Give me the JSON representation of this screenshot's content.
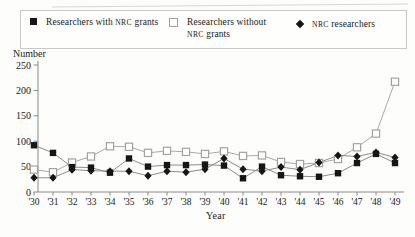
{
  "figure": {
    "ylabel": "Number",
    "xlabel": "Year"
  },
  "chart_data": {
    "type": "line",
    "title": "",
    "xlabel": "Year",
    "ylabel": "Number",
    "ylim": [
      0,
      250
    ],
    "yticks": [
      0,
      50,
      100,
      150,
      200,
      250
    ],
    "grid": false,
    "legend_position": "top",
    "categories": [
      "'30",
      "'31",
      "'32",
      "'33",
      "'34",
      "'35",
      "'36",
      "'37",
      "'38",
      "'39",
      "'40",
      "'41",
      "'42",
      "'43",
      "'44",
      "'45",
      "'46",
      "'47",
      "'48",
      "'49"
    ],
    "series": [
      {
        "name": "Researchers with NRC grants",
        "marker": "filled-square",
        "marker_color": "#161616",
        "line_color": "#8c8c8c",
        "values": [
          92,
          77,
          49,
          48,
          38,
          66,
          50,
          53,
          53,
          54,
          52,
          27,
          50,
          33,
          31,
          30,
          37,
          57,
          75,
          57
        ]
      },
      {
        "name": "Researchers without NRC grants",
        "marker": "open-square",
        "marker_color": "#ffffff",
        "marker_stroke": "#a2a29e",
        "line_color": "#aaaaa6",
        "values": [
          44,
          39,
          58,
          70,
          90,
          89,
          77,
          81,
          79,
          75,
          80,
          71,
          72,
          59,
          55,
          57,
          65,
          88,
          115,
          217
        ]
      },
      {
        "name": "NRC researchers",
        "marker": "filled-diamond",
        "marker_color": "#161616",
        "line_color": "#8c8c8c",
        "values": [
          28,
          28,
          44,
          42,
          41,
          41,
          32,
          41,
          39,
          45,
          66,
          45,
          41,
          49,
          44,
          58,
          72,
          70,
          78,
          68
        ]
      }
    ]
  }
}
